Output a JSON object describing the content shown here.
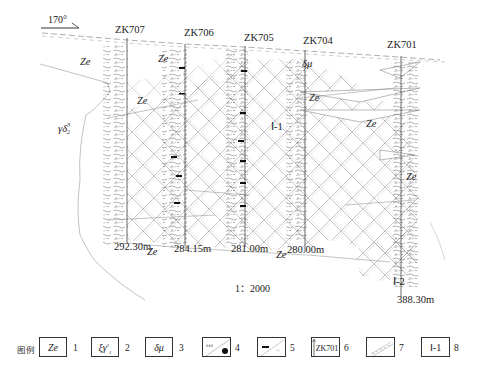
{
  "orientation": {
    "label": "170°"
  },
  "boreholes": [
    {
      "id": "ZK707",
      "label": "ZK707",
      "depth": "292.30m"
    },
    {
      "id": "ZK706",
      "label": "ZK706",
      "depth": "284.15m"
    },
    {
      "id": "ZK705",
      "label": "ZK705",
      "depth": "281.00m"
    },
    {
      "id": "ZK704",
      "label": "ZK704",
      "depth": "280.00m"
    },
    {
      "id": "ZK701",
      "label": "ZK701",
      "depth": "388.30m"
    }
  ],
  "unit_labels": {
    "ze_top_left": "Ze",
    "ze_top_mid": "Ze",
    "ze_mid_left": "Ze",
    "ze_bottom_707": "Ze",
    "ze_bottom_704": "Ze",
    "ze_mid_704": "Ze",
    "ze_701_upper": "Ze",
    "ze_701_right": "Ze",
    "dmu_704": "δμ",
    "gamma_delta": "γδ",
    "gamma_delta_sup": "3",
    "gamma_delta_sub": "2"
  },
  "orebodies": [
    {
      "label": "Ⅰ-1"
    },
    {
      "label": "Ⅰ-2"
    }
  ],
  "scale": {
    "label": "1：2000"
  },
  "legend": {
    "title": "图例",
    "items": [
      {
        "num": "1",
        "symbol": "Ze",
        "meaning": "Ze unit"
      },
      {
        "num": "2",
        "symbol": "ξγ",
        "sup": "2",
        "sub": "1",
        "meaning": "granite unit"
      },
      {
        "num": "3",
        "symbol": "δμ",
        "meaning": "diorite porphyrite"
      },
      {
        "num": "4",
        "symbol": "pattern-dot",
        "meaning": "sample/dot symbol"
      },
      {
        "num": "5",
        "symbol": "pattern-bar",
        "meaning": "bar symbol"
      },
      {
        "num": "6",
        "symbol": "ZK701",
        "meaning": "borehole"
      },
      {
        "num": "7",
        "symbol": "pattern-hatch",
        "meaning": "hatched ore zone"
      },
      {
        "num": "8",
        "symbol": "Ⅰ-1",
        "meaning": "orebody number"
      }
    ]
  },
  "colors": {
    "ink": "#222222",
    "line": "#555555",
    "hatch": "#9a9a9a",
    "light": "#bbbbbb",
    "background": "#ffffff"
  }
}
